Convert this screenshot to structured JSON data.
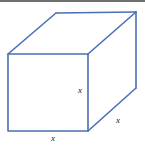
{
  "figure": {
    "name": "cube-wireframe-diagram",
    "background_color": "#ffffff",
    "edge_color": "#4a6fb5",
    "edge_width": 1.6,
    "top_rule_color": "#6e6e6e",
    "label_color": "#1a1a1a"
  },
  "labels": {
    "height": "x",
    "width": "x",
    "depth": "x"
  },
  "chart_data": {
    "type": "diagram",
    "title": "",
    "shape": "cube",
    "projection": "oblique",
    "canvas": {
      "width": 145,
      "height": 145
    },
    "vertices": {
      "front_top_left": [
        8,
        54
      ],
      "front_top_right": [
        88,
        54
      ],
      "front_bottom_right": [
        88,
        131
      ],
      "front_bottom_left": [
        8,
        131
      ],
      "back_top_left": [
        56,
        13
      ],
      "back_top_right": [
        136,
        12
      ],
      "back_bottom_right": [
        136,
        88
      ]
    },
    "visible_edges": [
      [
        "front_top_left",
        "front_top_right"
      ],
      [
        "front_top_right",
        "front_bottom_right"
      ],
      [
        "front_bottom_right",
        "front_bottom_left"
      ],
      [
        "front_bottom_left",
        "front_top_left"
      ],
      [
        "front_top_left",
        "back_top_left"
      ],
      [
        "back_top_left",
        "back_top_right"
      ],
      [
        "front_top_right",
        "back_top_right"
      ],
      [
        "back_top_right",
        "back_bottom_right"
      ],
      [
        "front_bottom_right",
        "back_bottom_right"
      ]
    ],
    "hidden_edges": [],
    "edge_labels": [
      {
        "edge": "front_top_right-front_bottom_right",
        "text": "x",
        "position": [
          78,
          91
        ]
      },
      {
        "edge": "front_bottom_left-front_bottom_right",
        "text": "x",
        "position": [
          51,
          139
        ]
      },
      {
        "edge": "front_bottom_right-back_bottom_right",
        "text": "x",
        "position": [
          116,
          121
        ]
      }
    ]
  }
}
